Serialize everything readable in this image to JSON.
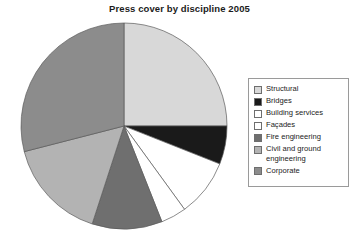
{
  "chart_data": {
    "type": "pie",
    "title": "Press cover by discipline 2005",
    "xlabel": "",
    "ylabel": "",
    "legend_position": "right",
    "grid": false,
    "start_angle": 0,
    "direction": "clockwise",
    "categories": [
      "Structural",
      "Bridges",
      "Building services",
      "Façades",
      "Fire engineering",
      "Civil and ground engineering",
      "Corporate"
    ],
    "values": [
      25,
      6,
      9,
      4,
      11,
      16,
      29
    ],
    "unit": "percent",
    "slices": [
      {
        "label": "Structural",
        "value": 25,
        "color": "#d8d8d8"
      },
      {
        "label": "Bridges",
        "value": 6,
        "color": "#1a1a1a"
      },
      {
        "label": "Building services",
        "value": 9,
        "color": "#ffffff"
      },
      {
        "label": "Façades",
        "value": 4,
        "color": "#ffffff"
      },
      {
        "label": "Fire engineering",
        "value": 11,
        "color": "#6f6f6f"
      },
      {
        "label": "Civil and ground engineering",
        "value": 16,
        "color": "#b3b3b3"
      },
      {
        "label": "Corporate",
        "value": 29,
        "color": "#8c8c8c"
      }
    ]
  },
  "legend": {
    "items": [
      {
        "label": "Structural",
        "color": "#d8d8d8",
        "swatch_name": "legend-swatch-structural"
      },
      {
        "label": "Bridges",
        "color": "#1a1a1a",
        "swatch_name": "legend-swatch-bridges"
      },
      {
        "label": "Building services",
        "color": "#ffffff",
        "swatch_name": "legend-swatch-building-services"
      },
      {
        "label": "Façades",
        "color": "#ffffff",
        "swatch_name": "legend-swatch-facades"
      },
      {
        "label": "Fire engineering",
        "color": "#6f6f6f",
        "swatch_name": "legend-swatch-fire-engineering"
      },
      {
        "label": "Civil and ground\nengineering",
        "color": "#b3b3b3",
        "swatch_name": "legend-swatch-civil-and-ground-engineering"
      },
      {
        "label": "Corporate",
        "color": "#8c8c8c",
        "swatch_name": "legend-swatch-corporate"
      }
    ]
  },
  "style": {
    "slice_outline": "#5a5a5a",
    "legend_border": "#9a9a9a",
    "title_color": "#1b1b1b",
    "background": "#ffffff"
  }
}
